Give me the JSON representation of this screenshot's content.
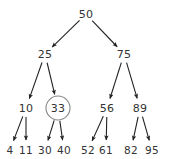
{
  "figure": {
    "background_color": "#ffffff",
    "edge_color": "#222222",
    "text_color": "#333333",
    "highlight_stroke_color": "#888888"
  },
  "tree": {
    "nodes": [
      {
        "id": "n50",
        "label": "50",
        "x": 86,
        "y": 14,
        "level": 0,
        "highlighted": false
      },
      {
        "id": "n25",
        "label": "25",
        "x": 45,
        "y": 54,
        "level": 1,
        "highlighted": false
      },
      {
        "id": "n75",
        "label": "75",
        "x": 124,
        "y": 54,
        "level": 1,
        "highlighted": false
      },
      {
        "id": "n10",
        "label": "10",
        "x": 26,
        "y": 108,
        "level": 2,
        "highlighted": false
      },
      {
        "id": "n33",
        "label": "33",
        "x": 58,
        "y": 108,
        "level": 2,
        "highlighted": true
      },
      {
        "id": "n56",
        "label": "56",
        "x": 107,
        "y": 108,
        "level": 2,
        "highlighted": false
      },
      {
        "id": "n89",
        "label": "89",
        "x": 140,
        "y": 108,
        "level": 2,
        "highlighted": false
      },
      {
        "id": "n4",
        "label": "4",
        "x": 10,
        "y": 150,
        "level": 3,
        "highlighted": false
      },
      {
        "id": "n11",
        "label": "11",
        "x": 26,
        "y": 150,
        "level": 3,
        "highlighted": false
      },
      {
        "id": "n30",
        "label": "30",
        "x": 45,
        "y": 150,
        "level": 3,
        "highlighted": false
      },
      {
        "id": "n40",
        "label": "40",
        "x": 64,
        "y": 150,
        "level": 3,
        "highlighted": false
      },
      {
        "id": "n52",
        "label": "52",
        "x": 88,
        "y": 150,
        "level": 3,
        "highlighted": false
      },
      {
        "id": "n61",
        "label": "61",
        "x": 106,
        "y": 150,
        "level": 3,
        "highlighted": false
      },
      {
        "id": "n82",
        "label": "82",
        "x": 131,
        "y": 150,
        "level": 3,
        "highlighted": false
      },
      {
        "id": "n95",
        "label": "95",
        "x": 152,
        "y": 150,
        "level": 3,
        "highlighted": false
      }
    ],
    "edges": [
      {
        "from": "n50",
        "to": "n25"
      },
      {
        "from": "n50",
        "to": "n75"
      },
      {
        "from": "n25",
        "to": "n10"
      },
      {
        "from": "n25",
        "to": "n33"
      },
      {
        "from": "n75",
        "to": "n56"
      },
      {
        "from": "n75",
        "to": "n89"
      },
      {
        "from": "n10",
        "to": "n4"
      },
      {
        "from": "n10",
        "to": "n11"
      },
      {
        "from": "n33",
        "to": "n30"
      },
      {
        "from": "n33",
        "to": "n40"
      },
      {
        "from": "n56",
        "to": "n52"
      },
      {
        "from": "n56",
        "to": "n61"
      },
      {
        "from": "n89",
        "to": "n82"
      },
      {
        "from": "n89",
        "to": "n95"
      }
    ],
    "highlight": {
      "node_id": "n33",
      "shape": "circle",
      "cx": 58,
      "cy": 108,
      "r": 12
    }
  }
}
